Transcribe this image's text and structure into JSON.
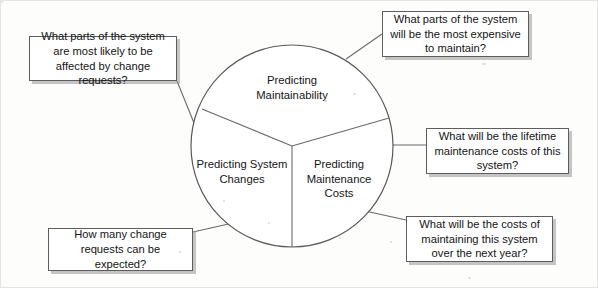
{
  "diagram": {
    "type": "hub-and-callouts",
    "center_circle": {
      "cx": 291,
      "cy": 145,
      "r": 101,
      "stroke": "#5a5a5a",
      "fill": "#ffffff",
      "sectors": [
        {
          "id": "maintainability",
          "label": "Predicting\nMaintainability",
          "label_x": 291,
          "label_y": 88
        },
        {
          "id": "maintenance-costs",
          "label": "Predicting\nMaintenance\nCosts",
          "label_x": 338,
          "label_y": 172
        },
        {
          "id": "system-changes",
          "label": "Predicting System\nChanges",
          "label_x": 241,
          "label_y": 172
        }
      ]
    },
    "callouts": [
      {
        "id": "affected-by-change-requests",
        "text": "What parts of the system are most likely to be affected by change requests?",
        "x": 28,
        "y": 35,
        "w": 148,
        "h": 45
      },
      {
        "id": "most-expensive-to-maintain",
        "text": "What parts of the system will be the most expensive to maintain?",
        "x": 381,
        "y": 10,
        "w": 147,
        "h": 46
      },
      {
        "id": "lifetime-maintenance-costs",
        "text": "What will be the lifetime maintenance costs of this system?",
        "x": 425,
        "y": 127,
        "w": 143,
        "h": 46
      },
      {
        "id": "costs-next-year",
        "text": "What will be the costs of maintaining this system over the next year?",
        "x": 405,
        "y": 215,
        "w": 147,
        "h": 46
      },
      {
        "id": "how-many-change-requests",
        "text": "How many change requests can be expected?",
        "x": 47,
        "y": 227,
        "w": 145,
        "h": 43
      }
    ],
    "connectors": [
      {
        "id": "connector-affected-by-change-requests",
        "points": "176,80 193,122"
      },
      {
        "id": "connector-most-expensive-to-maintain",
        "points": "381,33 345,58"
      },
      {
        "id": "connector-lifetime-maintenance-costs",
        "points": "425,144 372,144"
      },
      {
        "id": "connector-costs-next-year",
        "points": "405,219 355,208"
      },
      {
        "id": "connector-how-many-change-requests",
        "points": "192,231 232,222"
      }
    ],
    "divider_lines": [
      {
        "id": "divider-upper-left",
        "points": "291,145 201,108"
      },
      {
        "id": "divider-upper-right",
        "points": "291,145 388,117"
      },
      {
        "id": "divider-lower",
        "points": "291,145 291,246"
      }
    ]
  },
  "colors": {
    "page_background": "#fdfdfc",
    "box_border": "#5d5d5d",
    "box_fill": "#ffffff",
    "circle_stroke": "#5a5a5a",
    "text": "#141414",
    "shadow": "rgba(150,150,150,0.55)"
  }
}
